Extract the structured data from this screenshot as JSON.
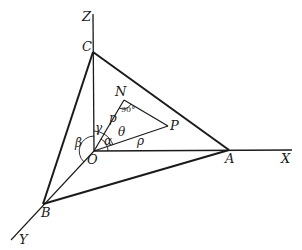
{
  "diagram": {
    "type": "3d-coordinate-geometry",
    "axes": {
      "x_label": "X",
      "y_label": "Y",
      "z_label": "Z"
    },
    "points": {
      "origin": "O",
      "a": "A",
      "b": "B",
      "c": "C",
      "n": "N",
      "p": "P"
    },
    "segment_labels": {
      "on": "p",
      "op": "ρ"
    },
    "angles": {
      "alpha": "α",
      "beta": "β",
      "gamma": "γ",
      "theta": "θ",
      "right_angle": "90°"
    },
    "colors": {
      "line": "#1a1a1a",
      "background": "#ffffff"
    }
  }
}
